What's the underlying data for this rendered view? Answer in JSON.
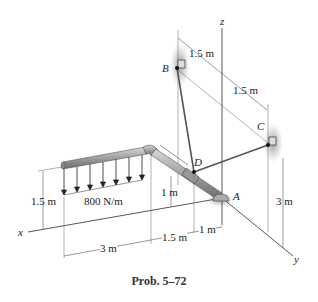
{
  "figure": {
    "caption": "Prob. 5–72",
    "axes": {
      "x": "x",
      "y": "y",
      "z": "z"
    },
    "points": {
      "A": "A",
      "B": "B",
      "C": "C",
      "D": "D"
    },
    "load": {
      "label": "800 N/m",
      "type": "distributed load"
    },
    "dimensions": {
      "B_to_z": "1.5 m",
      "z_to_C": "1.5 m",
      "C_height": "3 m",
      "load_height": "1.5 m",
      "D_height": "1 m",
      "x_3m": "3 m",
      "x_1_5m": "1.5 m",
      "x_1m": "1 m"
    },
    "colors": {
      "pipe": "#9a9a9a",
      "pipe_dark": "#6e6e6e",
      "line": "#333333",
      "shadow": "#9c9c9c"
    }
  }
}
